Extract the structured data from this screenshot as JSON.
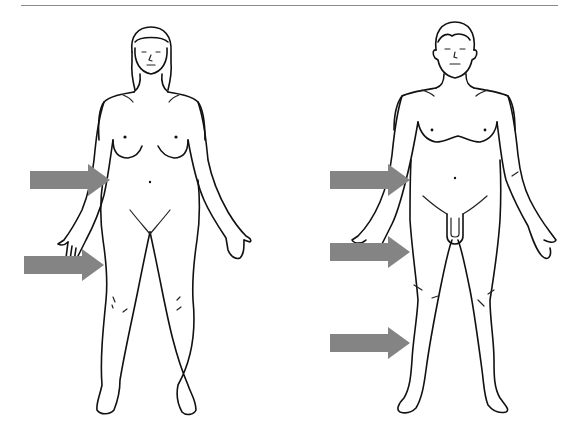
{
  "diagram": {
    "rule_color": "#8a8a8a",
    "arrow_color": "#848484",
    "line_color": "#111111",
    "figures": [
      {
        "id": "female",
        "label": "",
        "arrows": [
          {
            "region": "upper-arm / flank",
            "x": 30,
            "y": 180,
            "length": 80
          },
          {
            "region": "hand / hip",
            "x": 24,
            "y": 265,
            "length": 80
          }
        ]
      },
      {
        "id": "male",
        "label": "",
        "arrows": [
          {
            "region": "upper-arm / flank",
            "x": 330,
            "y": 180,
            "length": 80
          },
          {
            "region": "hand / thigh",
            "x": 330,
            "y": 252,
            "length": 80
          },
          {
            "region": "lower leg",
            "x": 330,
            "y": 343,
            "length": 80
          }
        ]
      }
    ]
  }
}
